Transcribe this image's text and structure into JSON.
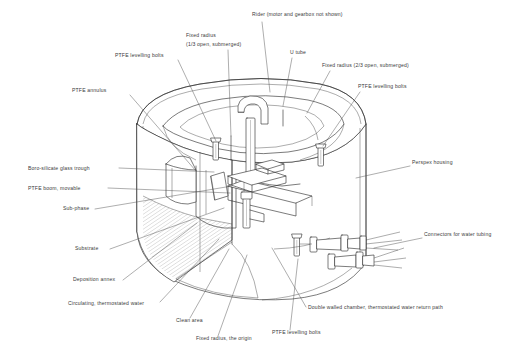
{
  "figure": {
    "background_color": "#ffffff",
    "line_color": "#2b2b2b",
    "label_color": "#3a3a3a"
  },
  "labels": [
    {
      "id": "rider",
      "text": "Rider (motor and gearbox not shown)",
      "x": 252,
      "y": 16,
      "anchor": "start"
    },
    {
      "id": "fixed-radius-13",
      "text": "Fixed radius",
      "x": 186,
      "y": 37,
      "anchor": "start"
    },
    {
      "id": "fixed-radius-13b",
      "text": "(1/3 open, submerged)",
      "x": 186,
      "y": 46,
      "anchor": "start"
    },
    {
      "id": "u-tube",
      "text": "U tube",
      "x": 290,
      "y": 54,
      "anchor": "start"
    },
    {
      "id": "fixed-radius-23",
      "text": "Fixed radius (2/3 open, submerged)",
      "x": 322,
      "y": 67,
      "anchor": "start"
    },
    {
      "id": "ptfe-bolts-top",
      "text": "PTFE levelling bolts",
      "x": 115,
      "y": 57,
      "anchor": "start"
    },
    {
      "id": "ptfe-bolts-right",
      "text": "PTFE levelling bolts",
      "x": 358,
      "y": 88,
      "anchor": "start"
    },
    {
      "id": "ptfe-annulus",
      "text": "PTFE annulus",
      "x": 72,
      "y": 92,
      "anchor": "start"
    },
    {
      "id": "perspex-housing",
      "text": "Perspex housing",
      "x": 412,
      "y": 164,
      "anchor": "start"
    },
    {
      "id": "glass-trough",
      "text": "Boro-silicate glass trough",
      "x": 28,
      "y": 170,
      "anchor": "start"
    },
    {
      "id": "ptfe-boom",
      "text": "PTFE boom, movable",
      "x": 28,
      "y": 190,
      "anchor": "start"
    },
    {
      "id": "sub-phase",
      "text": "Sub-phase",
      "x": 63,
      "y": 210,
      "anchor": "start"
    },
    {
      "id": "substrate",
      "text": "Substrate",
      "x": 75,
      "y": 250,
      "anchor": "start"
    },
    {
      "id": "connectors",
      "text": "Connectors for water tubing",
      "x": 424,
      "y": 236,
      "anchor": "start"
    },
    {
      "id": "deposition-annex",
      "text": "Deposition annex",
      "x": 73,
      "y": 281,
      "anchor": "start"
    },
    {
      "id": "circ-water",
      "text": "Circulating, thermostated water",
      "x": 68,
      "y": 305,
      "anchor": "start"
    },
    {
      "id": "double-walled",
      "text": "Double walled chamber, thermostated water return path",
      "x": 308,
      "y": 309,
      "anchor": "start"
    },
    {
      "id": "clean-area",
      "text": "Clean area",
      "x": 176,
      "y": 322,
      "anchor": "start"
    },
    {
      "id": "ptfe-bolts-bot",
      "text": "PTFE levelling bolts",
      "x": 272,
      "y": 334,
      "anchor": "start"
    },
    {
      "id": "fixed-radius-org",
      "text": "Fixed radius, the origin",
      "x": 196,
      "y": 340,
      "anchor": "start"
    }
  ],
  "leaders": [
    {
      "id": "leader-rider",
      "d": "M 262 22 L 270 92"
    },
    {
      "id": "leader-fixed13",
      "d": "M 228 50 L 231 136"
    },
    {
      "id": "leader-utube",
      "d": "M 292 58 L 283 106"
    },
    {
      "id": "leader-fixed23",
      "d": "M 330 71 L 307 113"
    },
    {
      "id": "leader-bolts-top",
      "d": "M 178 60 L 216 141"
    },
    {
      "id": "leader-bolts-right",
      "d": "M 360 92 L 323 146"
    },
    {
      "id": "leader-annulus",
      "d": "M 130 95 L 196 171"
    },
    {
      "id": "leader-perspex",
      "d": "M 410 166 L 356 178"
    },
    {
      "id": "leader-trough",
      "d": "M 119 168 L 214 172"
    },
    {
      "id": "leader-boom",
      "d": "M 108 188 L 230 193"
    },
    {
      "id": "leader-subphase",
      "d": "M 95 209 L 232 186"
    },
    {
      "id": "leader-substrate",
      "d": "M 110 249 L 224 208"
    },
    {
      "id": "leader-connectors",
      "d": "M 422 238 L 374 248"
    },
    {
      "id": "leader-annex",
      "d": "M 123 280 L 197 223"
    },
    {
      "id": "leader-circwater",
      "d": "M 160 302 L 219 239"
    },
    {
      "id": "leader-doublewall",
      "d": "M 306 307 L 272 248"
    },
    {
      "id": "leader-cleanarea",
      "d": "M 190 318 L 229 249"
    },
    {
      "id": "leader-bolts-bot",
      "d": "M 290 330 L 298 259"
    },
    {
      "id": "leader-fixedorigin",
      "d": "M 218 336 L 247 255"
    }
  ]
}
